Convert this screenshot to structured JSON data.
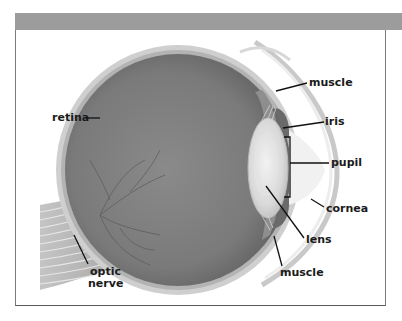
{
  "diagram": {
    "header_bar_color": "#9c9c9c",
    "frame_border_color": "#7a7a7a",
    "label_color": "#1a1a1a",
    "labels": {
      "retina": "retina",
      "muscle_top": "muscle",
      "iris": "iris",
      "pupil": "pupil",
      "cornea": "cornea",
      "lens": "lens",
      "muscle_bottom": "muscle",
      "optic_line1": "optic",
      "optic_line2": "nerve"
    },
    "colors": {
      "vitreous": "#7d7d7d",
      "sclera": "#c8c8c8",
      "choroid": "#a9a9a9",
      "lens": "#dedede",
      "iris": "#6e6e6e",
      "cornea": "#e4e4e4",
      "optic_nerve": "#b0b0b0"
    }
  }
}
